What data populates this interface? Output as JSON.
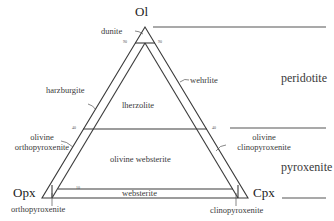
{
  "diagram": {
    "type": "ternary-classification",
    "vertices": {
      "top": "Ol",
      "left": "Opx",
      "right": "Cpx"
    },
    "fields": {
      "dunite": "dunite",
      "harzburgite": "harzburgite",
      "lherzolite": "lherzolite",
      "wehrlite": "wehrlite",
      "olivine_orthopyroxenite_1": "olivine",
      "olivine_orthopyroxenite_2": "orthopyroxenite",
      "olivine_clinopyroxenite_1": "olivine",
      "olivine_clinopyroxenite_2": "clinopyroxenite",
      "olivine_websterite": "olivine websterite",
      "websterite": "websterite",
      "orthopyroxenite": "orthopyroxenite",
      "clinopyroxenite": "clinopyroxenite"
    },
    "groups": {
      "peridotite": "peridotite",
      "pyroxenite": "pyroxenite"
    },
    "ticks": {
      "t90_left": "90",
      "t90_right": "90",
      "t40_left": "40",
      "t40_right": "40",
      "t10_left": "10"
    },
    "colors": {
      "line": "#3a3a3a",
      "text": "#3a3a3a"
    }
  }
}
